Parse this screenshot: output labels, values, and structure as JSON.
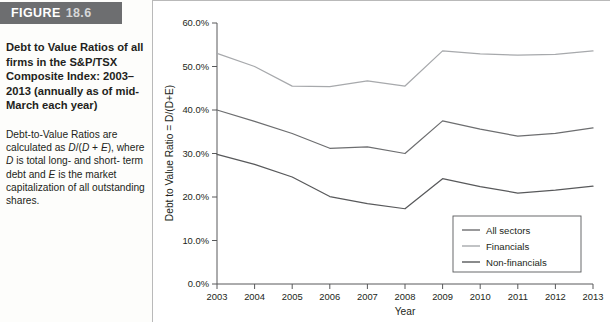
{
  "figure": {
    "banner_word": "FIGURE",
    "banner_number": "18.6",
    "banner_bg": "#6d6e70",
    "title": "Debt to Value Ratios of all firms in the S&P/TSX Composite Index: 2003–2013 (annually as of mid-March each year)",
    "body_line1": "Debt-to-Value Ratios are",
    "body_line2_a": "calculated as ",
    "body_line2_b": "D",
    "body_line2_c": "/(",
    "body_line2_d": "D",
    "body_line2_e": " + ",
    "body_line2_f": "E",
    "body_line2_g": "), where",
    "body_line3_a": "D",
    "body_line3_b": " is total long- and short-",
    "body_line4_a": "term debt and ",
    "body_line4_b": "E",
    "body_line4_c": " is the market",
    "body_line5": "capitalization of all outstanding",
    "body_line6": "shares."
  },
  "chart_data": {
    "type": "line",
    "title": "",
    "xlabel": "Year",
    "ylabel": "Debt to Value Ratio = D/(D+E)",
    "categories": [
      "2003",
      "2004",
      "2005",
      "2006",
      "2007",
      "2008",
      "2009",
      "2010",
      "2011",
      "2012",
      "2013"
    ],
    "x": [
      2003,
      2004,
      2005,
      2006,
      2007,
      2008,
      2009,
      2010,
      2011,
      2012,
      2013
    ],
    "xlim": [
      2003,
      2013
    ],
    "ylim": [
      0,
      60
    ],
    "yticks": [
      0,
      10,
      20,
      30,
      40,
      50,
      60
    ],
    "ytick_labels": [
      "0.0%",
      "10.0%",
      "20.0%",
      "30.0%",
      "40.0%",
      "50.0%",
      "60.0%"
    ],
    "grid": false,
    "legend_position": "lower-right",
    "series": [
      {
        "name": "All sectors",
        "color": "#6d6e70",
        "values": [
          40.0,
          37.4,
          34.6,
          31.2,
          31.5,
          30.0,
          37.5,
          35.6,
          34.0,
          34.6,
          35.9
        ]
      },
      {
        "name": "Financials",
        "color": "#a7a9ac",
        "values": [
          53.0,
          50.0,
          45.5,
          45.4,
          46.7,
          45.5,
          53.6,
          52.9,
          52.6,
          52.8,
          53.6
        ]
      },
      {
        "name": "Non-financials",
        "color": "#58595b",
        "values": [
          29.8,
          27.5,
          24.6,
          20.1,
          18.5,
          17.3,
          24.2,
          22.4,
          20.9,
          21.6,
          22.5
        ]
      }
    ]
  }
}
